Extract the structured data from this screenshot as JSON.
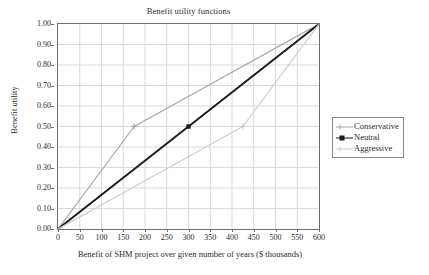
{
  "chart_data": {
    "type": "line",
    "title": "Benefit utility functions",
    "xlabel": "Benefit of SHM project over given number of years ($ thousands)",
    "ylabel": "Benefit utility",
    "xlim": [
      0,
      600
    ],
    "ylim": [
      0,
      1.0
    ],
    "xticks": [
      0,
      50,
      100,
      150,
      200,
      250,
      300,
      350,
      400,
      450,
      500,
      550,
      600
    ],
    "xtick_labels": [
      "0",
      "50",
      "100",
      "150",
      "200",
      "250",
      "300",
      "350",
      "400",
      "450",
      "500",
      "550",
      "600"
    ],
    "yticks": [
      0.0,
      0.1,
      0.2,
      0.3,
      0.4,
      0.5,
      0.6,
      0.7,
      0.8,
      0.9,
      1.0
    ],
    "ytick_labels": [
      "0.00",
      "0.10",
      "0.20",
      "0.30",
      "0.40",
      "0.50",
      "0.60",
      "0.70",
      "0.80",
      "0.90",
      "1.00"
    ],
    "grid": true,
    "grid_color": "#d9d9d9",
    "frame_color": "#6e6e6e",
    "legend_position": "right-outside",
    "series": [
      {
        "name": "Conservative",
        "color": "#a6a6a6",
        "width": 1.2,
        "marker": "plus",
        "shape": "concave",
        "x": [
          0,
          175,
          600
        ],
        "y": [
          0.0,
          0.5,
          1.0
        ],
        "markers_x": [
          175
        ],
        "markers_y": [
          0.5
        ]
      },
      {
        "name": "Neutral",
        "color": "#1a1a1a",
        "width": 1.9,
        "marker": "square",
        "shape": "linear",
        "x": [
          0,
          300,
          600
        ],
        "y": [
          0.0,
          0.5,
          1.0
        ],
        "markers_x": [
          300
        ],
        "markers_y": [
          0.5
        ]
      },
      {
        "name": "Aggressive",
        "color": "#cccccc",
        "width": 1.2,
        "marker": "plus",
        "shape": "convex",
        "x": [
          0,
          425,
          600
        ],
        "y": [
          0.0,
          0.5,
          1.0
        ],
        "markers_x": [
          425
        ],
        "markers_y": [
          0.5
        ]
      }
    ]
  },
  "legend": {
    "entries": [
      {
        "label": "Conservative"
      },
      {
        "label": "Neutral"
      },
      {
        "label": "Aggressive"
      }
    ]
  }
}
